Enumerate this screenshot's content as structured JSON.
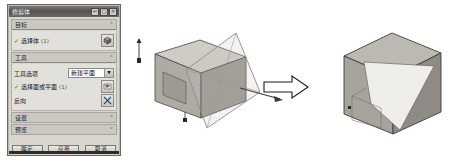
{
  "dialog": {
    "title": "修剪体",
    "title_buttons": [
      {
        "name": "restore",
        "glyph": "↩"
      },
      {
        "name": "maximize",
        "glyph": "□"
      },
      {
        "name": "close",
        "glyph": "✕"
      }
    ],
    "sections": [
      {
        "id": "target",
        "label": "目标",
        "state": "expanded",
        "chevron": "˄"
      },
      {
        "id": "tool",
        "label": "工具",
        "state": "expanded",
        "chevron": "˄"
      },
      {
        "id": "settings",
        "label": "设置",
        "state": "collapsed",
        "chevron": "˅"
      },
      {
        "id": "preview",
        "label": "预览",
        "state": "collapsed",
        "chevron": "˅"
      }
    ],
    "target": {
      "select_body_label": "选择体",
      "select_body_count": "(1)",
      "checkmark": "✓",
      "select_body_icon": "select-body-icon"
    },
    "tool": {
      "tool_option_label": "工具选项",
      "tool_option_value": "新建平面",
      "tool_option_arrow": "▼",
      "select_face_label": "选择面或平面",
      "select_face_count": "(1)",
      "checkmark": "✓",
      "select_face_icon": "select-face-icon",
      "reverse_label": "反向",
      "reverse_icon": "reverse-direction-icon"
    },
    "buttons": [
      {
        "id": "ok",
        "label": "确定"
      },
      {
        "id": "apply",
        "label": "应用"
      },
      {
        "id": "cancel",
        "label": "取消"
      }
    ]
  },
  "viewport": {
    "before_label": "box-with-trim-plane",
    "arrow_label": "transform-arrow",
    "after_label": "trimmed-box-result"
  },
  "colors": {
    "dialog_bg": "#d8d5cf",
    "titlebar": "#56534e",
    "section_header": "#cbc8c2",
    "panel": "#e2e0db",
    "check_green": "#2d6b2d",
    "model_face_light": "#d9d6d1",
    "model_face_mid": "#b3afa9",
    "model_face_dark": "#93908a",
    "model_edge": "#4a4845",
    "plane_edge": "#8a8782",
    "arrow_stroke": "#1c1a18"
  }
}
